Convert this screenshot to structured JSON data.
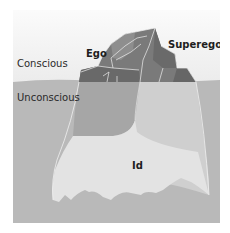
{
  "diagram": {
    "labels": {
      "conscious": "Conscious",
      "unconscious": "Unconscious",
      "ego": "Ego",
      "superego": "Superego",
      "id": "Id"
    },
    "colors": {
      "sky_top": "#f7f7f7",
      "sky_bottom": "#ebebeb",
      "water": "#b8b8b8",
      "ice_top_dark": "#6e6e6e",
      "ice_top_mid": "#8a8a8a",
      "ice_under_left": "#a9a9a9",
      "ice_under_right": "#cbcbcb",
      "ice_id": "#e4e4e4",
      "edge": "#f2f2f2"
    }
  }
}
